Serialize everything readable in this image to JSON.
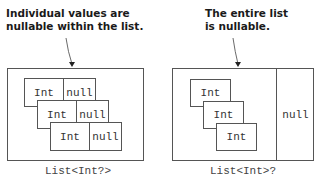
{
  "left_panel": {
    "annotation_line1": "Individual values are",
    "annotation_line2": "nullable within the list.",
    "items": [
      {
        "value": "Int",
        "null_label": "null"
      },
      {
        "value": "Int",
        "null_label": "null"
      },
      {
        "value": "Int",
        "null_label": "null"
      }
    ],
    "caption": "List<Int?>"
  },
  "right_panel": {
    "annotation_line1": "The entire list",
    "annotation_line2": "is nullable.",
    "items": [
      {
        "value": "Int"
      },
      {
        "value": "Int"
      },
      {
        "value": "Int"
      }
    ],
    "null_label": "null",
    "caption": "List<Int>?"
  },
  "colors": {
    "stroke": "#555555",
    "text": "#1a1a1a",
    "background": "#ffffff"
  }
}
